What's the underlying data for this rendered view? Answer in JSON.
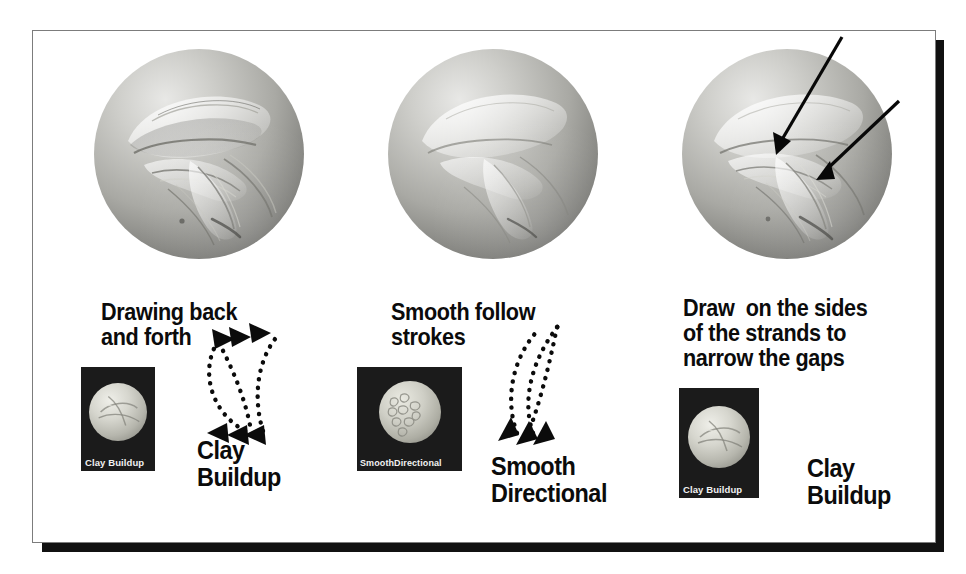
{
  "figure": {
    "frame_color": "#7c7c7c",
    "shadow_color": "#111111",
    "text_color": "#0b0b0b",
    "thumb_bg": "#1b1b1b",
    "thumb_label_color": "#f2f2f2"
  },
  "panels": [
    {
      "id": "panel-1",
      "headline": "Drawing back\nand forth",
      "brush_name": "Clay\nBuildup",
      "thumbnail_label": "Clay Buildup",
      "thumbnail_icon": "clay-buildup-brush-thumbnail",
      "sphere_icon": "sculpted-sphere-stage-1",
      "arrow_style": "dotted-double-headed-lens",
      "arrowheads": "both-ends",
      "callout_arrows": 0
    },
    {
      "id": "panel-2",
      "headline": "Smooth follow\nstrokes",
      "brush_name": "Smooth\nDirectional",
      "thumbnail_label": "SmoothDirectional",
      "thumbnail_icon": "smooth-directional-brush-thumbnail",
      "sphere_icon": "sculpted-sphere-stage-2",
      "arrow_style": "dotted-lens",
      "arrowheads": "bottom-left-only",
      "callout_arrows": 0
    },
    {
      "id": "panel-3",
      "headline": "Draw  on the sides\nof the strands to\nnarrow the gaps",
      "brush_name": "Clay\nBuildup",
      "thumbnail_label": "Clay Buildup",
      "thumbnail_icon": "clay-buildup-brush-thumbnail",
      "sphere_icon": "sculpted-sphere-stage-3",
      "arrow_style": "none",
      "arrowheads": "none",
      "callout_arrows": 2
    }
  ]
}
